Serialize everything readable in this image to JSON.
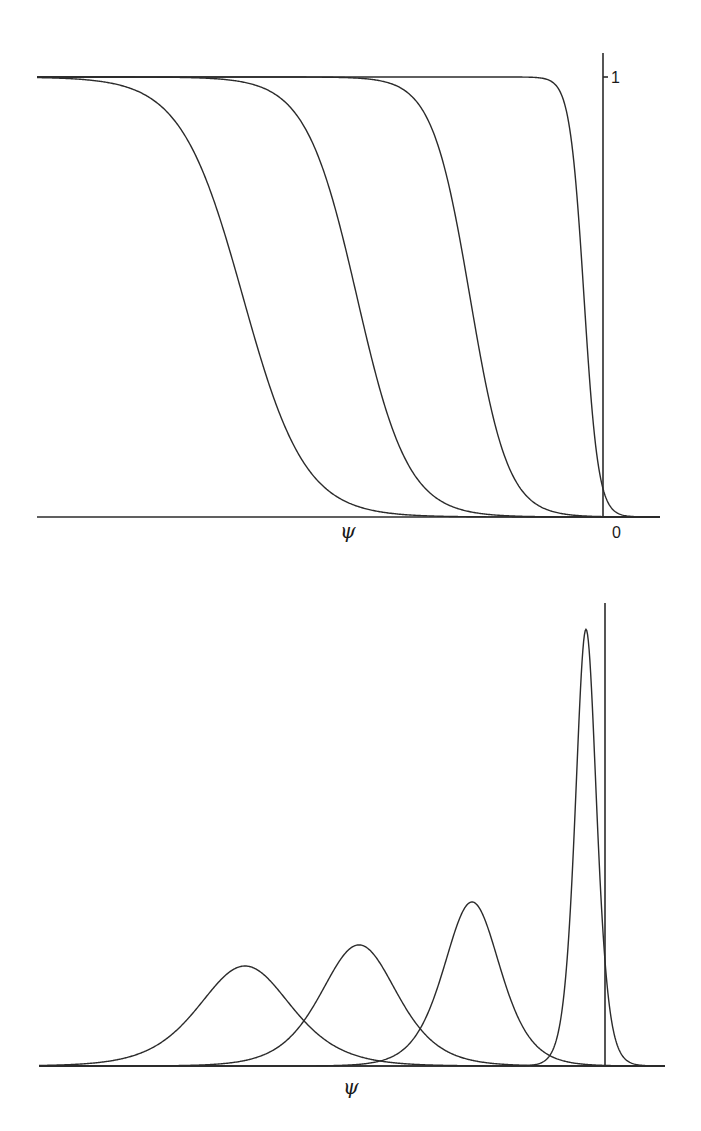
{
  "chart_data": [
    {
      "type": "line",
      "title": "",
      "xlabel": "ψ",
      "ylabel": "",
      "xlim": [
        -5.66,
        0.57
      ],
      "ylim": [
        0,
        1
      ],
      "y_ticks": [
        {
          "value": 1,
          "label": "1"
        }
      ],
      "x_ticks": [
        {
          "value": 0,
          "label": "0"
        }
      ],
      "grid": false,
      "legend": "none",
      "function": "logistic step 1/(1+exp((psi-center)/scale))",
      "series": [
        {
          "name": "curve-1",
          "center": -3.6,
          "scale": 0.31
        },
        {
          "name": "curve-2",
          "center": -2.46,
          "scale": 0.256
        },
        {
          "name": "curve-3",
          "center": -1.33,
          "scale": 0.189
        },
        {
          "name": "curve-4",
          "center": -0.19,
          "scale": 0.071
        }
      ]
    },
    {
      "type": "line",
      "title": "",
      "xlabel": "ψ",
      "ylabel": "",
      "xlim": [
        -5.66,
        0.6
      ],
      "ylim": [
        0,
        3.8
      ],
      "grid": false,
      "legend": "none",
      "function": "derivative of logistic: e^u/(scale*(1+e^u)^2), u=(psi-center)/scale",
      "series": [
        {
          "name": "peak-1",
          "center": -3.6,
          "scale": 0.31,
          "peak": 0.81
        },
        {
          "name": "peak-2",
          "center": -2.46,
          "scale": 0.256,
          "peak": 0.98
        },
        {
          "name": "peak-3",
          "center": -1.33,
          "scale": 0.189,
          "peak": 1.32
        },
        {
          "name": "peak-4",
          "center": -0.19,
          "scale": 0.071,
          "peak": 3.52
        }
      ]
    }
  ]
}
